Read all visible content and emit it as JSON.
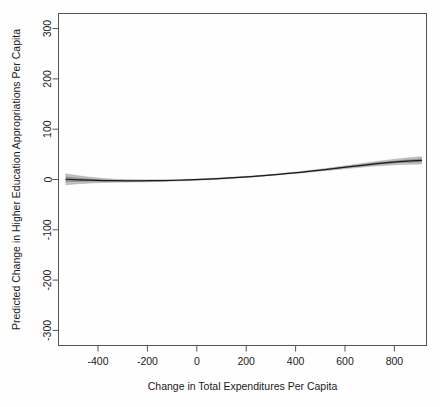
{
  "chart_data": {
    "type": "line",
    "title": "",
    "subtitle": "",
    "xlabel": "Change in Total Expenditures Per Capita",
    "ylabel": "Predicted Change in Higher Education Appropriations Per Capita",
    "xlim": [
      -560,
      930
    ],
    "ylim": [
      -330,
      330
    ],
    "xticks": [
      -400,
      -200,
      0,
      200,
      400,
      600,
      800
    ],
    "xtick_labels": [
      "-400",
      "-200",
      "0",
      "200",
      "400",
      "600",
      "800"
    ],
    "yticks": [
      -300,
      -200,
      -100,
      0,
      100,
      200,
      300
    ],
    "ytick_labels": [
      "-300",
      "-200",
      "-100",
      "0",
      "100",
      "200",
      "300"
    ],
    "grid": false,
    "legend": "none",
    "line_color": "#1c1c1c",
    "band_color": "#9a9a9a",
    "axis_color": "#555555",
    "background_color": "#fefefe",
    "series": [
      {
        "name": "Predicted change",
        "x": [
          -530,
          -480,
          -430,
          -380,
          -330,
          -280,
          -230,
          -180,
          -130,
          -80,
          -30,
          20,
          70,
          120,
          170,
          220,
          270,
          320,
          370,
          420,
          470,
          520,
          570,
          620,
          670,
          720,
          770,
          820,
          870,
          910
        ],
        "values": [
          0.5,
          -0.6,
          -1.4,
          -2.0,
          -2.4,
          -2.6,
          -2.6,
          -2.4,
          -2.0,
          -1.5,
          -0.8,
          0.2,
          1.3,
          2.6,
          4.1,
          5.8,
          7.7,
          9.8,
          12.0,
          14.4,
          17.0,
          19.7,
          22.6,
          25.5,
          28.3,
          31.0,
          33.4,
          35.5,
          37.2,
          38.2
        ]
      },
      {
        "name": "Confidence band lower",
        "x": [
          -530,
          -480,
          -430,
          -380,
          -330,
          -280,
          -230,
          -180,
          -130,
          -80,
          -30,
          20,
          70,
          120,
          170,
          220,
          270,
          320,
          370,
          420,
          470,
          520,
          570,
          620,
          670,
          720,
          770,
          820,
          870,
          910
        ],
        "values": [
          -10.5,
          -8.5,
          -7.0,
          -6.0,
          -5.4,
          -5.0,
          -4.7,
          -4.3,
          -3.7,
          -3.0,
          -2.2,
          -1.2,
          0.0,
          1.4,
          3.0,
          4.7,
          6.6,
          8.6,
          10.7,
          12.9,
          15.2,
          17.6,
          20.0,
          22.4,
          24.7,
          26.7,
          28.4,
          29.7,
          30.5,
          30.8
        ]
      },
      {
        "name": "Confidence band upper",
        "x": [
          -530,
          -480,
          -430,
          -380,
          -330,
          -280,
          -230,
          -180,
          -130,
          -80,
          -30,
          20,
          70,
          120,
          170,
          220,
          270,
          320,
          370,
          420,
          470,
          520,
          570,
          620,
          670,
          720,
          770,
          820,
          870,
          910
        ],
        "values": [
          11.5,
          7.4,
          4.3,
          2.1,
          0.6,
          -0.2,
          -0.5,
          -0.5,
          -0.3,
          0.0,
          0.6,
          1.6,
          2.7,
          4.0,
          5.4,
          7.0,
          8.9,
          11.0,
          13.3,
          15.9,
          18.8,
          21.8,
          25.1,
          28.5,
          31.9,
          35.2,
          38.4,
          41.3,
          43.8,
          45.4
        ]
      }
    ]
  }
}
